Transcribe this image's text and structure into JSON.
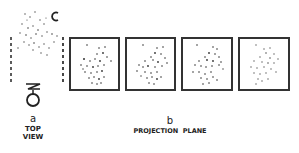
{
  "panels": {
    "a": {
      "letter": "a",
      "title_line1": "TOP",
      "title_line2": "VIEW"
    },
    "b": {
      "letter": "b",
      "title": "PROJECTION  PLANE"
    }
  },
  "icons": {
    "rotation": "rotation-arrow-icon",
    "eye": "eye-viewer-icon",
    "spring": "spring-icon"
  },
  "frames": [
    {
      "x": 69,
      "y": 37,
      "w": 51,
      "h": 54
    },
    {
      "x": 125,
      "y": 37,
      "w": 51,
      "h": 54
    },
    {
      "x": 181,
      "y": 37,
      "w": 52,
      "h": 54
    },
    {
      "x": 238,
      "y": 37,
      "w": 52,
      "h": 54
    }
  ],
  "colors": {
    "ink": "#222222",
    "background": "#ffffff"
  }
}
